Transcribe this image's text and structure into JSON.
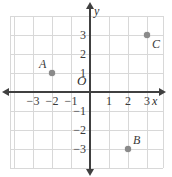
{
  "chart_data": {
    "type": "scatter",
    "title": "",
    "xlabel": "x",
    "ylabel": "y",
    "origin_label": "O",
    "grid": true,
    "xlim": [
      -4.2,
      3.9
    ],
    "ylim": [
      -4.0,
      4.2
    ],
    "xticks": [
      -3,
      -2,
      -1,
      1,
      2,
      3
    ],
    "yticks": [
      3,
      2,
      1,
      -1,
      -2,
      -3
    ],
    "xtick_labels": [
      "−3",
      "−2",
      "−1",
      "1",
      "2",
      "3"
    ],
    "ytick_labels": [
      "3",
      "2",
      "1",
      "−1",
      "−2",
      "−3"
    ],
    "points": [
      {
        "label": "A",
        "x": -2,
        "y": 1,
        "label_dx": -13,
        "label_dy": -15
      },
      {
        "label": "B",
        "x": 2,
        "y": -3,
        "label_dx": 5,
        "label_dy": -15
      },
      {
        "label": "C",
        "x": 3,
        "y": 3,
        "label_dx": 5,
        "label_dy": 3
      }
    ],
    "point_color": "#8a8a8a",
    "axis_color": "#404040",
    "grid_color": "#d8d8d8"
  },
  "geometry": {
    "origin_px_x": 90,
    "origin_px_y": 92,
    "unit_px": 19
  }
}
